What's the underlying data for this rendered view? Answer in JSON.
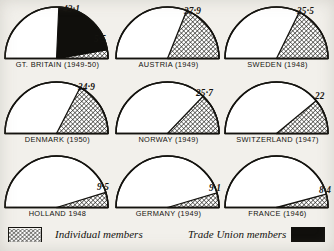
{
  "chart_data": {
    "type": "pie",
    "title": "",
    "subtitle": "",
    "units": "percent of electorate",
    "layout": "3x3 grid of half-pie (semicircle) gauges, 180 degrees = 100%",
    "legend": {
      "position": "bottom",
      "entries": [
        {
          "key": "individual",
          "label": "Individual members",
          "pattern": "diagonal-hatch",
          "color": "#14130f"
        },
        {
          "key": "trade_union",
          "label": "Trade Union members",
          "pattern": "solid",
          "color": "#100f0c"
        }
      ]
    },
    "series": [
      {
        "name": "Individual members",
        "pattern": "diagonal-hatch"
      },
      {
        "name": "Trade Union members",
        "pattern": "solid-black"
      }
    ],
    "categories": [
      "GT. BRITAIN (1949-50)",
      "AUSTRIA (1949)",
      "SWEDEN (1948)",
      "DENMARK (1950)",
      "NORWAY (1949)",
      "SWITZERLAND (1947)",
      "HOLLAND 1948",
      "GERMANY (1949)",
      "FRANCE (1946)"
    ],
    "panels": [
      {
        "label": "GT. BRITAIN (1949-50)",
        "country": "GT. BRITAIN",
        "year": "1949-50",
        "trade_union": 43.1,
        "trade_union_text": "43·1",
        "individual": 5.5,
        "individual_text": "5·5",
        "total": 48.6
      },
      {
        "label": "AUSTRIA (1949)",
        "country": "AUSTRIA",
        "year": "1949",
        "trade_union": 0,
        "trade_union_text": "",
        "individual": 37.9,
        "individual_text": "37·9",
        "total": 37.9
      },
      {
        "label": "SWEDEN (1948)",
        "country": "SWEDEN",
        "year": "1948",
        "trade_union": 0,
        "trade_union_text": "",
        "individual": 35.5,
        "individual_text": "35·5",
        "total": 35.5
      },
      {
        "label": "DENMARK (1950)",
        "country": "DENMARK",
        "year": "1950",
        "trade_union": 0,
        "trade_union_text": "",
        "individual": 34.9,
        "individual_text": "34·9",
        "total": 34.9
      },
      {
        "label": "NORWAY (1949)",
        "country": "NORWAY",
        "year": "1949",
        "trade_union": 0,
        "trade_union_text": "",
        "individual": 25.7,
        "individual_text": "25·7",
        "total": 25.7
      },
      {
        "label": "SWITZERLAND (1947)",
        "country": "SWITZERLAND",
        "year": "1947",
        "trade_union": 0,
        "trade_union_text": "",
        "individual": 22,
        "individual_text": "22",
        "total": 22
      },
      {
        "label": "HOLLAND 1948",
        "country": "HOLLAND",
        "year": "1948",
        "trade_union": 0,
        "trade_union_text": "",
        "individual": 9.5,
        "individual_text": "9·5",
        "total": 9.5
      },
      {
        "label": "GERMANY (1949)",
        "country": "GERMANY",
        "year": "1949",
        "trade_union": 0,
        "trade_union_text": "",
        "individual": 9.1,
        "individual_text": "9·1",
        "total": 9.1
      },
      {
        "label": "FRANCE (1946)",
        "country": "FRANCE",
        "year": "1946",
        "trade_union": 0,
        "trade_union_text": "",
        "individual": 8.4,
        "individual_text": "8·4",
        "total": 8.4
      }
    ]
  },
  "panels": [
    {
      "caption": "GT. BRITAIN (1949-50)",
      "v1": "43·1",
      "v2": "5·5"
    },
    {
      "caption": "AUSTRIA (1949)",
      "v1": "37·9",
      "v2": ""
    },
    {
      "caption": "SWEDEN (1948)",
      "v1": "35·5",
      "v2": ""
    },
    {
      "caption": "DENMARK (1950)",
      "v1": "34·9",
      "v2": ""
    },
    {
      "caption": "NORWAY (1949)",
      "v1": "25·7",
      "v2": ""
    },
    {
      "caption": "SWITZERLAND (1947)",
      "v1": "22",
      "v2": ""
    },
    {
      "caption": "HOLLAND 1948",
      "v1": "9·5",
      "v2": ""
    },
    {
      "caption": "GERMANY (1949)",
      "v1": "9·1",
      "v2": ""
    },
    {
      "caption": "FRANCE (1946)",
      "v1": "8·4",
      "v2": ""
    }
  ],
  "legend": {
    "individual_label": "Individual members",
    "trade_union_label": "Trade Union members"
  }
}
